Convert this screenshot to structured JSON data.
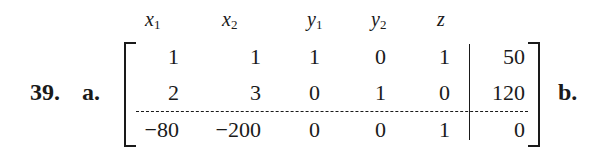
{
  "problem": {
    "number": "39.",
    "part_a": "a.",
    "part_b": "b."
  },
  "matrix": {
    "headers": [
      {
        "var": "x",
        "sub": "1"
      },
      {
        "var": "x",
        "sub": "2"
      },
      {
        "var": "y",
        "sub": "1"
      },
      {
        "var": "y",
        "sub": "2"
      },
      {
        "var": "z",
        "sub": ""
      }
    ],
    "rows": [
      [
        "1",
        "1",
        "1",
        "0",
        "1",
        "50"
      ],
      [
        "2",
        "3",
        "0",
        "1",
        "0",
        "120"
      ],
      [
        "−80",
        "−200",
        "0",
        "0",
        "1",
        "0"
      ]
    ]
  }
}
